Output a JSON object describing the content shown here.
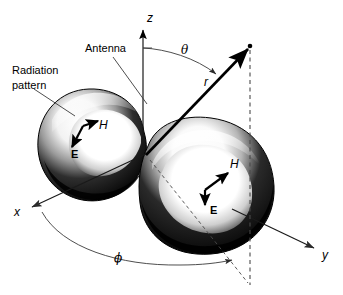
{
  "figure": {
    "background_color": "#ffffff",
    "ink_color": "#000000",
    "width": 343,
    "height": 295
  },
  "annotations": {
    "radiation_pattern_line1": "Radiation",
    "radiation_pattern_line2": "pattern",
    "antenna": "Antenna"
  },
  "axes": [
    {
      "name": "z-axis",
      "label": "z"
    },
    {
      "name": "x-axis",
      "label": "x"
    },
    {
      "name": "y-axis",
      "label": "y"
    }
  ],
  "coordinates": [
    {
      "name": "radial-distance",
      "label": "r"
    },
    {
      "name": "polar-angle",
      "label": "θ"
    },
    {
      "name": "azimuthal-angle",
      "label": "ϕ"
    }
  ],
  "field_vectors": {
    "left_lobe": [
      {
        "name": "magnetic-field",
        "label": "H"
      },
      {
        "name": "electric-field",
        "label": "E"
      }
    ],
    "right_lobe": [
      {
        "name": "magnetic-field",
        "label": "H"
      },
      {
        "name": "electric-field",
        "label": "E"
      }
    ]
  }
}
